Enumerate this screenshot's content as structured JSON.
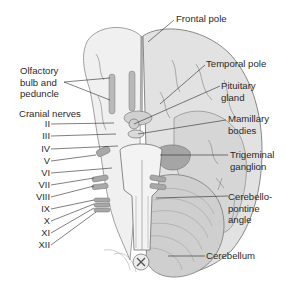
{
  "figure": {
    "colors": {
      "background": "#ffffff",
      "cortex_fill": "#e4e4e4",
      "cortex_dark": "#bdbdbd",
      "outline": "#7a7a7a",
      "brainstem_fill": "#f2f2f2",
      "nerve_fill": "#a8a8a8",
      "leader_line": "#2a2a2a",
      "text": "#2a2a2a"
    }
  },
  "labels_right": {
    "frontal_pole": "Frontal pole",
    "temporal_pole": "Temporal pole",
    "pituitary_gland": [
      "Pituitary",
      "gland"
    ],
    "mamillary_bodies": [
      "Mamillary",
      "bodies"
    ],
    "trigeminal_ganglion": [
      "Trigeminal",
      "ganglion"
    ],
    "cerebellopontine_angle": [
      "Cerebello-",
      "pontine",
      "angle"
    ],
    "cerebellum": "Cerebellum"
  },
  "labels_left": {
    "olfactory": [
      "Olfactory",
      "bulb and",
      "peduncle"
    ],
    "cranial_nerves_heading": "Cranial nerves",
    "cranial_nerves": [
      "II",
      "III",
      "IV",
      "V",
      "VI",
      "VII",
      "VIII",
      "IX",
      "X",
      "XI",
      "XII"
    ]
  }
}
